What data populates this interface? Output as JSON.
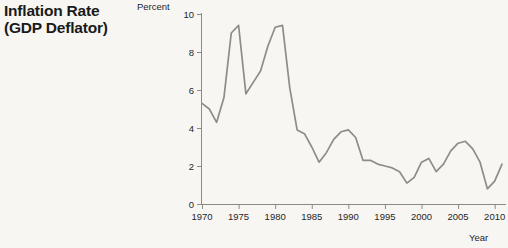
{
  "figure": {
    "title_lines": [
      "Inflation Rate",
      "(GDP Deflator)"
    ],
    "y_axis_unit": "Percent",
    "x_axis_label": "Year",
    "line_color": "#8d8c8a",
    "axis_color": "#8c8a87",
    "background_color": "#f7f6f3",
    "text_color": "#262626"
  },
  "chart_data": {
    "type": "line",
    "title": "Inflation Rate (GDP Deflator)",
    "xlabel": "Year",
    "ylabel": "Percent",
    "xlim": [
      1970,
      2011
    ],
    "ylim": [
      0,
      10
    ],
    "grid": false,
    "legend": "none",
    "xticks": [
      1970,
      1975,
      1980,
      1985,
      1990,
      1995,
      2000,
      2005,
      2010
    ],
    "yticks": [
      0,
      2,
      4,
      6,
      8,
      10
    ],
    "series": [
      {
        "name": "Inflation Rate (GDP Deflator)",
        "x": [
          1970,
          1971,
          1972,
          1973,
          1974,
          1975,
          1976,
          1977,
          1978,
          1979,
          1980,
          1981,
          1982,
          1983,
          1984,
          1985,
          1986,
          1987,
          1988,
          1989,
          1990,
          1991,
          1992,
          1993,
          1994,
          1995,
          1996,
          1997,
          1998,
          1999,
          2000,
          2001,
          2002,
          2003,
          2004,
          2005,
          2006,
          2007,
          2008,
          2009,
          2010,
          2011
        ],
        "values": [
          5.3,
          5.0,
          4.3,
          5.6,
          9.0,
          9.4,
          5.8,
          6.4,
          7.0,
          8.3,
          9.3,
          9.4,
          6.1,
          3.9,
          3.7,
          3.0,
          2.2,
          2.7,
          3.4,
          3.8,
          3.9,
          3.5,
          2.3,
          2.3,
          2.1,
          2.0,
          1.9,
          1.7,
          1.1,
          1.4,
          2.2,
          2.4,
          1.7,
          2.1,
          2.8,
          3.2,
          3.3,
          2.9,
          2.2,
          0.8,
          1.2,
          2.1
        ]
      }
    ]
  }
}
